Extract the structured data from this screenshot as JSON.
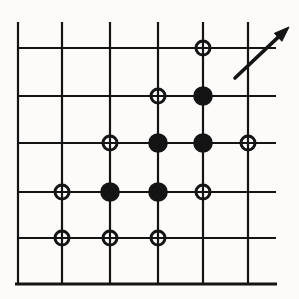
{
  "figure": {
    "name": "lattice-cluster-diagram",
    "width": 299,
    "height": 299,
    "background": "#fcfbf9",
    "ink": "#141414"
  },
  "grid": {
    "stroke_width": 2.2,
    "vlines": {
      "xs": [
        18,
        62,
        110,
        158,
        203,
        248
      ],
      "y_top": 22,
      "y_bottom": 284
    },
    "hlines": {
      "ys": [
        48,
        96,
        143,
        192,
        238
      ],
      "x_left": 17,
      "x_right": 276
    },
    "baseline": {
      "y": 284,
      "x_left": 15,
      "x_right": 277,
      "stroke_width": 3.2
    }
  },
  "markers": {
    "occupied_sites": [
      [
        203,
        96
      ],
      [
        158,
        143
      ],
      [
        203,
        143
      ],
      [
        110,
        192
      ],
      [
        158,
        192
      ]
    ],
    "occupied_radius": 9.8,
    "perimeter_sites": [
      [
        203,
        48
      ],
      [
        158,
        96
      ],
      [
        110,
        143
      ],
      [
        248,
        143
      ],
      [
        62,
        192
      ],
      [
        203,
        192
      ],
      [
        62,
        238
      ],
      [
        110,
        238
      ],
      [
        158,
        238
      ]
    ],
    "perimeter_radius": 7,
    "perimeter_stroke_width": 3
  },
  "arrow": {
    "x1": 235,
    "y1": 78,
    "x2": 289,
    "y2": 27,
    "shaft_width": 3.6,
    "head_length": 15,
    "head_width": 11
  }
}
